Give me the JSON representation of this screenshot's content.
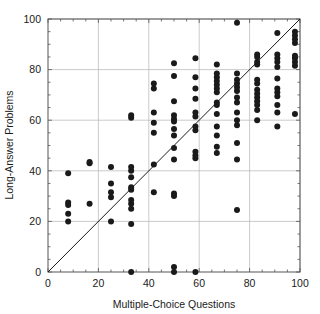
{
  "chart_data": {
    "type": "scatter",
    "title": "",
    "xlabel": "Multiple-Choice Questions",
    "ylabel": "Long-Answer Problems",
    "xlim": [
      0,
      100
    ],
    "ylim": [
      0,
      100
    ],
    "xticks": [
      0,
      20,
      40,
      60,
      80,
      100
    ],
    "yticks": [
      0,
      20,
      40,
      60,
      80,
      100
    ],
    "xtick_labels": [
      "0",
      "20",
      "40",
      "60",
      "80",
      "100"
    ],
    "ytick_labels": [
      "0",
      "20",
      "40",
      "60",
      "80",
      "100"
    ],
    "grid": true,
    "grid_color": "#b4b4b4",
    "legend": "none",
    "marker_color": "#1a1a1a",
    "marker_size": 3.0,
    "reference_line": {
      "name": "identity-line",
      "from": [
        0,
        0
      ],
      "to": [
        100,
        100
      ],
      "color": "#1a1a1a"
    },
    "points": [
      [
        8,
        20
      ],
      [
        8,
        23
      ],
      [
        8,
        26.5
      ],
      [
        8,
        27.5
      ],
      [
        8,
        39
      ],
      [
        16.5,
        27
      ],
      [
        16.5,
        43
      ],
      [
        16.5,
        43.5
      ],
      [
        25,
        20
      ],
      [
        25,
        29.5
      ],
      [
        25,
        31.5
      ],
      [
        25,
        35
      ],
      [
        25,
        41.5
      ],
      [
        33,
        0
      ],
      [
        33,
        19
      ],
      [
        33,
        25
      ],
      [
        33,
        27
      ],
      [
        33,
        28.5
      ],
      [
        33,
        32.5
      ],
      [
        33,
        33.5
      ],
      [
        33,
        37.5
      ],
      [
        33,
        40
      ],
      [
        33,
        41.5
      ],
      [
        33,
        61
      ],
      [
        33,
        62
      ],
      [
        42,
        31.5
      ],
      [
        42,
        42.5
      ],
      [
        42,
        55
      ],
      [
        42,
        59
      ],
      [
        42,
        63
      ],
      [
        42,
        72.5
      ],
      [
        42,
        74.5
      ],
      [
        50,
        0
      ],
      [
        50,
        2
      ],
      [
        50,
        30
      ],
      [
        50,
        31
      ],
      [
        50,
        44.5
      ],
      [
        50,
        49
      ],
      [
        50,
        54
      ],
      [
        50,
        56.5
      ],
      [
        50,
        59.5
      ],
      [
        50,
        60.5
      ],
      [
        50,
        62
      ],
      [
        50,
        67.5
      ],
      [
        50,
        77.5
      ],
      [
        50,
        82.5
      ],
      [
        58.5,
        0
      ],
      [
        58.5,
        45
      ],
      [
        58.5,
        46
      ],
      [
        58.5,
        47.5
      ],
      [
        58.5,
        56
      ],
      [
        58.5,
        57.5
      ],
      [
        58.5,
        61.5
      ],
      [
        58.5,
        63
      ],
      [
        58.5,
        68.5
      ],
      [
        58.5,
        72.5
      ],
      [
        58.5,
        77
      ],
      [
        58.5,
        84.5
      ],
      [
        67,
        47
      ],
      [
        67,
        49.5
      ],
      [
        67,
        54
      ],
      [
        67,
        57.5
      ],
      [
        67,
        62.5
      ],
      [
        67,
        66
      ],
      [
        67,
        67
      ],
      [
        67,
        71
      ],
      [
        67,
        72.5
      ],
      [
        67,
        74
      ],
      [
        67,
        75.5
      ],
      [
        67,
        77
      ],
      [
        67,
        78.5
      ],
      [
        67,
        82
      ],
      [
        75,
        24.5
      ],
      [
        75,
        44.5
      ],
      [
        75,
        51
      ],
      [
        75,
        58
      ],
      [
        75,
        60
      ],
      [
        75,
        63
      ],
      [
        75,
        67
      ],
      [
        75,
        69
      ],
      [
        75,
        71.5
      ],
      [
        75,
        73
      ],
      [
        75,
        74.5
      ],
      [
        75,
        76
      ],
      [
        75,
        78.5
      ],
      [
        75,
        98.5
      ],
      [
        83,
        60
      ],
      [
        83,
        64
      ],
      [
        83,
        66
      ],
      [
        83,
        67.5
      ],
      [
        83,
        69
      ],
      [
        83,
        70.5
      ],
      [
        83,
        72
      ],
      [
        83,
        74.5
      ],
      [
        83,
        76
      ],
      [
        83,
        82
      ],
      [
        83,
        83
      ],
      [
        83,
        85
      ],
      [
        83,
        86
      ],
      [
        91,
        57.5
      ],
      [
        91,
        63
      ],
      [
        91,
        66
      ],
      [
        91,
        69.5
      ],
      [
        91,
        71
      ],
      [
        91,
        72.5
      ],
      [
        91,
        76.5
      ],
      [
        91,
        81
      ],
      [
        91,
        83
      ],
      [
        91,
        84.5
      ],
      [
        91,
        86
      ],
      [
        91,
        94.5
      ],
      [
        98,
        62.5
      ],
      [
        98,
        81.5
      ],
      [
        98,
        83
      ],
      [
        98,
        84.5
      ],
      [
        98,
        85.5
      ],
      [
        98,
        90.5
      ],
      [
        98,
        92
      ],
      [
        98,
        93.5
      ],
      [
        98,
        95
      ]
    ]
  }
}
